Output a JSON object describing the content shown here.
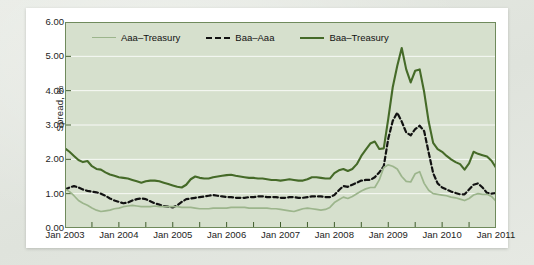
{
  "figure": {
    "ylabel": "Spread, %",
    "plot_bg": "#d6e0cd",
    "gridline_color": "#ffffff"
  },
  "legend": {
    "position": "top-inside",
    "items": [
      {
        "label": "Aaa–Treasury",
        "color": "#9cb58c",
        "style": "solid"
      },
      {
        "label": "Baa–Aaa",
        "color": "#121212",
        "style": "dashed"
      },
      {
        "label": "Baa–Treasury",
        "color": "#456a28",
        "style": "solid"
      }
    ]
  },
  "axes": {
    "y_ticks": [
      "6.00",
      "5.00",
      "4.00",
      "3.00",
      "2.00",
      "1.00",
      "0.00"
    ],
    "x_ticks": [
      "Jan 2003",
      "Jan 2004",
      "Jan 2005",
      "Jan 2006",
      "Jan 2007",
      "Jan 2008",
      "Jan 2009",
      "Jan 2010",
      "Jan 2011"
    ]
  },
  "chart_data": {
    "type": "line",
    "title": "",
    "xlabel": "",
    "ylabel": "Spread, %",
    "ylim": [
      0,
      6
    ],
    "xlim": [
      "Jan 2003",
      "Jan 2011"
    ],
    "grid": true,
    "legend_position": "top-inside",
    "x": [
      "Jan 2003",
      "Feb 2003",
      "Mar 2003",
      "Apr 2003",
      "May 2003",
      "Jun 2003",
      "Jul 2003",
      "Aug 2003",
      "Sep 2003",
      "Oct 2003",
      "Nov 2003",
      "Dec 2003",
      "Jan 2004",
      "Feb 2004",
      "Mar 2004",
      "Apr 2004",
      "May 2004",
      "Jun 2004",
      "Jul 2004",
      "Aug 2004",
      "Sep 2004",
      "Oct 2004",
      "Nov 2004",
      "Dec 2004",
      "Jan 2005",
      "Feb 2005",
      "Mar 2005",
      "Apr 2005",
      "May 2005",
      "Jun 2005",
      "Jul 2005",
      "Aug 2005",
      "Sep 2005",
      "Oct 2005",
      "Nov 2005",
      "Dec 2005",
      "Jan 2006",
      "Feb 2006",
      "Mar 2006",
      "Apr 2006",
      "May 2006",
      "Jun 2006",
      "Jul 2006",
      "Aug 2006",
      "Sep 2006",
      "Oct 2006",
      "Nov 2006",
      "Dec 2006",
      "Jan 2007",
      "Feb 2007",
      "Mar 2007",
      "Apr 2007",
      "May 2007",
      "Jun 2007",
      "Jul 2007",
      "Aug 2007",
      "Sep 2007",
      "Oct 2007",
      "Nov 2007",
      "Dec 2007",
      "Jan 2008",
      "Feb 2008",
      "Mar 2008",
      "Apr 2008",
      "May 2008",
      "Jun 2008",
      "Jul 2008",
      "Aug 2008",
      "Sep 2008",
      "Oct 2008",
      "Nov 2008",
      "Dec 2008",
      "Jan 2009",
      "Feb 2009",
      "Mar 2009",
      "Apr 2009",
      "May 2009",
      "Jun 2009",
      "Jul 2009",
      "Aug 2009",
      "Sep 2009",
      "Oct 2009",
      "Nov 2009",
      "Dec 2009",
      "Jan 2010",
      "Feb 2010",
      "Mar 2010",
      "Apr 2010",
      "May 2010",
      "Jun 2010",
      "Jul 2010",
      "Aug 2010",
      "Sep 2010",
      "Oct 2010",
      "Nov 2010",
      "Dec 2010",
      "Jan 2011"
    ],
    "series": [
      {
        "name": "Baa–Treasury",
        "color": "#456a28",
        "style": "solid",
        "values": [
          2.32,
          2.22,
          2.1,
          1.98,
          1.92,
          1.95,
          1.8,
          1.72,
          1.7,
          1.62,
          1.56,
          1.52,
          1.48,
          1.46,
          1.44,
          1.4,
          1.36,
          1.32,
          1.36,
          1.38,
          1.38,
          1.36,
          1.32,
          1.28,
          1.24,
          1.2,
          1.18,
          1.26,
          1.42,
          1.5,
          1.46,
          1.44,
          1.44,
          1.48,
          1.5,
          1.52,
          1.54,
          1.55,
          1.52,
          1.5,
          1.48,
          1.46,
          1.46,
          1.44,
          1.44,
          1.42,
          1.4,
          1.4,
          1.38,
          1.4,
          1.42,
          1.4,
          1.38,
          1.38,
          1.42,
          1.48,
          1.48,
          1.46,
          1.44,
          1.44,
          1.6,
          1.68,
          1.72,
          1.66,
          1.72,
          1.86,
          2.1,
          2.28,
          2.46,
          2.52,
          2.3,
          2.32,
          3.18,
          4.1,
          4.72,
          5.24,
          4.62,
          4.24,
          4.58,
          4.62,
          3.96,
          3.1,
          2.48,
          2.3,
          2.22,
          2.1,
          2.0,
          1.92,
          1.86,
          1.7,
          1.88,
          2.22,
          2.16,
          2.12,
          2.08,
          1.96,
          1.76
        ]
      },
      {
        "name": "Baa–Aaa",
        "color": "#121212",
        "style": "dashed",
        "values": [
          1.12,
          1.18,
          1.22,
          1.18,
          1.12,
          1.08,
          1.06,
          1.04,
          1.0,
          0.94,
          0.86,
          0.8,
          0.76,
          0.72,
          0.74,
          0.8,
          0.84,
          0.86,
          0.84,
          0.78,
          0.72,
          0.68,
          0.64,
          0.62,
          0.6,
          0.66,
          0.76,
          0.84,
          0.86,
          0.88,
          0.9,
          0.92,
          0.94,
          0.96,
          0.94,
          0.92,
          0.9,
          0.9,
          0.88,
          0.88,
          0.88,
          0.9,
          0.9,
          0.92,
          0.92,
          0.9,
          0.9,
          0.9,
          0.88,
          0.88,
          0.9,
          0.9,
          0.88,
          0.88,
          0.9,
          0.92,
          0.92,
          0.92,
          0.9,
          0.9,
          0.96,
          1.1,
          1.22,
          1.2,
          1.26,
          1.32,
          1.38,
          1.4,
          1.4,
          1.48,
          1.62,
          1.8,
          2.6,
          3.12,
          3.36,
          3.1,
          2.78,
          2.7,
          2.88,
          2.98,
          2.82,
          2.2,
          1.6,
          1.3,
          1.18,
          1.12,
          1.06,
          1.02,
          0.98,
          0.98,
          1.12,
          1.26,
          1.3,
          1.18,
          1.02,
          1.0,
          1.02
        ]
      },
      {
        "name": "Aaa–Treasury",
        "color": "#9cb58c",
        "style": "solid",
        "values": [
          1.14,
          1.06,
          0.94,
          0.8,
          0.72,
          0.66,
          0.58,
          0.52,
          0.48,
          0.5,
          0.52,
          0.56,
          0.58,
          0.62,
          0.64,
          0.66,
          0.64,
          0.62,
          0.62,
          0.62,
          0.64,
          0.62,
          0.62,
          0.62,
          0.62,
          0.62,
          0.6,
          0.6,
          0.6,
          0.58,
          0.56,
          0.56,
          0.56,
          0.58,
          0.58,
          0.58,
          0.58,
          0.6,
          0.6,
          0.6,
          0.6,
          0.58,
          0.58,
          0.58,
          0.58,
          0.58,
          0.56,
          0.56,
          0.54,
          0.52,
          0.5,
          0.48,
          0.52,
          0.56,
          0.58,
          0.56,
          0.54,
          0.52,
          0.54,
          0.6,
          0.74,
          0.82,
          0.9,
          0.86,
          0.92,
          1.0,
          1.08,
          1.14,
          1.18,
          1.18,
          1.4,
          1.76,
          1.84,
          1.8,
          1.72,
          1.5,
          1.36,
          1.34,
          1.58,
          1.64,
          1.3,
          1.1,
          1.0,
          0.98,
          0.96,
          0.94,
          0.9,
          0.88,
          0.84,
          0.8,
          0.86,
          0.96,
          1.0,
          0.98,
          0.98,
          0.92,
          0.78
        ]
      }
    ]
  }
}
